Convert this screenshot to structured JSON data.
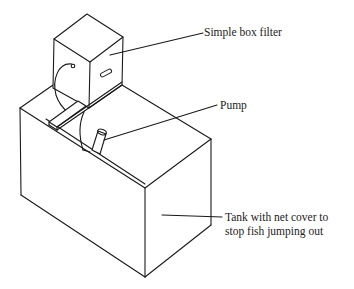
{
  "diagram": {
    "colors": {
      "line": "#1a1a1a",
      "text": "#222222",
      "background": "#ffffff"
    },
    "components": [
      {
        "id": "filter",
        "name": "Simple box filter"
      },
      {
        "id": "pump",
        "name": "Pump"
      },
      {
        "id": "tank",
        "name": "Tank with net cover to stop fish jumping out"
      }
    ],
    "labels": {
      "filter": "Simple box filter",
      "pump": "Pump",
      "tank_line1": "Tank with net cover to",
      "tank_line2": "stop fish jumping out"
    }
  }
}
